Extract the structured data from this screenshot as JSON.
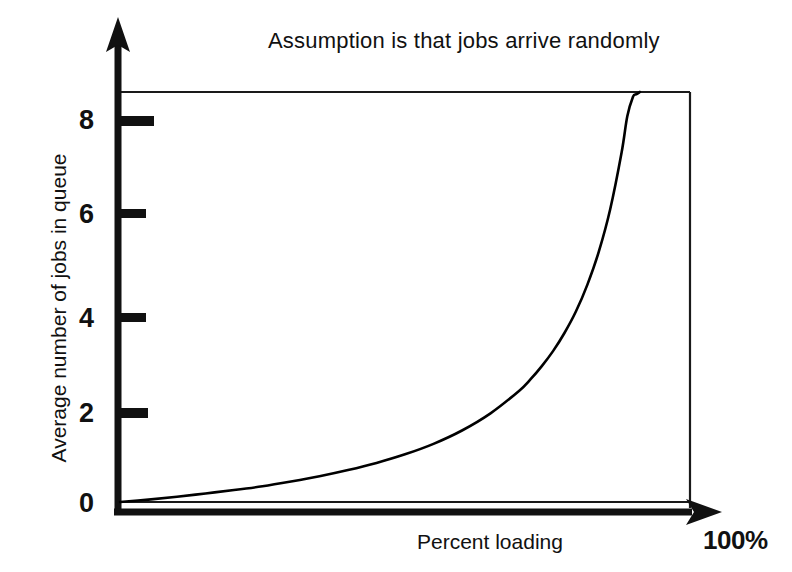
{
  "chart_data": {
    "type": "line",
    "title": "Assumption is that jobs arrive randomly",
    "xlabel": "Percent loading",
    "ylabel": "Average number of jobs in queue",
    "xlim": [
      0,
      100
    ],
    "ylim": [
      0,
      8.6
    ],
    "grid": false,
    "legend": null,
    "x_axis_max_label": "100%",
    "y_ticks": [
      0,
      2,
      4,
      6,
      8
    ],
    "y_tick_labels": [
      "0",
      "2",
      "4",
      "6",
      "8"
    ],
    "x_ticks": [],
    "x_tick_labels": [],
    "axis_arrows": {
      "y_axis": "up-arrow",
      "x_axis": "right-arrow"
    },
    "series": [
      {
        "name": "Average number of jobs in queue",
        "formula": "L = rho / (1 - rho)",
        "color": "#000000",
        "x": [
          0,
          5,
          10,
          15,
          20,
          25,
          30,
          35,
          40,
          45,
          50,
          55,
          60,
          65,
          70,
          72,
          74,
          76,
          78,
          80,
          82,
          84,
          86,
          88,
          89,
          90,
          90.5,
          91,
          91.2
        ],
        "y": [
          0.0,
          0.05,
          0.11,
          0.18,
          0.25,
          0.33,
          0.43,
          0.54,
          0.67,
          0.82,
          1.0,
          1.22,
          1.5,
          1.86,
          2.33,
          2.57,
          2.85,
          3.17,
          3.55,
          4.0,
          4.56,
          5.25,
          6.14,
          7.33,
          8.09,
          8.5,
          8.55,
          8.58,
          8.6
        ]
      }
    ]
  },
  "title_text": "Assumption is that jobs arrive randomly",
  "axes": {
    "y_title": "Average number of jobs in queue",
    "x_title": "Percent loading",
    "x_end_label": "100%",
    "y_tick_labels": [
      "8",
      "6",
      "4",
      "2",
      "0"
    ]
  }
}
